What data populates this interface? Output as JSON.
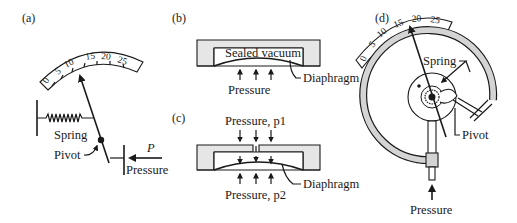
{
  "figure": {
    "panels": [
      {
        "id": "a",
        "label": "(a)",
        "scale_ticks": [
          "0",
          "5",
          "10",
          "15",
          "20",
          "25"
        ],
        "labels": {
          "spring": "Spring",
          "pivot": "Pivot",
          "force": "P",
          "pressure": "Pressure"
        }
      },
      {
        "id": "b",
        "label": "(b)",
        "labels": {
          "chamber": "Sealed vacuum",
          "diaphragm": "Diaphragm",
          "pressure": "Pressure"
        }
      },
      {
        "id": "c",
        "label": "(c)",
        "labels": {
          "pressure_top": "Pressure, p1",
          "pressure_bottom": "Pressure, p2",
          "diaphragm": "Diaphragm"
        }
      },
      {
        "id": "d",
        "label": "(d)",
        "scale_ticks": [
          "0",
          "5",
          "10",
          "15",
          "20",
          "25"
        ],
        "labels": {
          "spring": "Spring",
          "pivot": "Pivot",
          "pressure": "Pressure"
        }
      }
    ]
  }
}
